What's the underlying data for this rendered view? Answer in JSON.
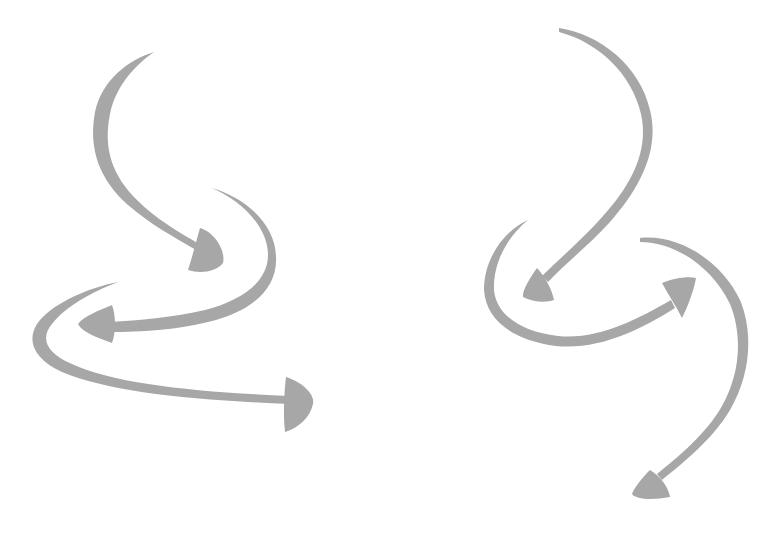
{
  "image": {
    "width": 784,
    "height": 544,
    "background": "#ffffff",
    "description": "Two groups of hand-drawn curved gray arrows on white background"
  },
  "colors": {
    "arrow": "#a7a7a7",
    "background": "#ffffff"
  },
  "groups": [
    {
      "name": "left-arrow-group",
      "arrows": [
        {
          "id": "left-arrow-1",
          "direction": "down-right",
          "head_at": [
            212,
            255
          ]
        },
        {
          "id": "left-arrow-2",
          "direction": "left",
          "head_at": [
            80,
            322
          ]
        },
        {
          "id": "left-arrow-3",
          "direction": "right",
          "head_at": [
            312,
            402
          ]
        }
      ]
    },
    {
      "name": "right-arrow-group",
      "arrows": [
        {
          "id": "right-arrow-1",
          "direction": "down-left",
          "head_at": [
            524,
            297
          ]
        },
        {
          "id": "right-arrow-2",
          "direction": "up-right",
          "head_at": [
            696,
            280
          ]
        },
        {
          "id": "right-arrow-3",
          "direction": "down-left",
          "head_at": [
            633,
            485
          ]
        }
      ]
    }
  ]
}
